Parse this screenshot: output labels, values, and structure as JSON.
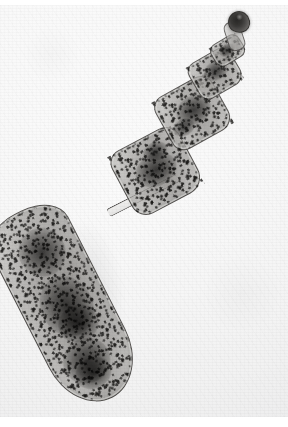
{
  "image": {
    "kind": "photomicrograph",
    "medium": "light microscopy, stained whole mount",
    "rendering": "grayscale",
    "subject": "adult cestode (tapeworm) whole specimen",
    "orientation": "diagonal, scolex at upper right, gravid proglottid at lower left",
    "caption": "Grayscale photomicrograph of an adult tapeworm whole mount: dark scolex at upper right, short neck, three small proglottids, and a large gravid terminal proglottid packed with dark eggs.",
    "background_color": "#f4f4f4",
    "border_color": "#ffffff",
    "has_scale_bar": false,
    "has_labels": false,
    "has_text": false
  },
  "canvas": {
    "width_px": 288,
    "height_px": 427,
    "photo_top_px": 5,
    "photo_height_px": 412
  },
  "palette": {
    "background": "#f4f4f4",
    "background_light": "#fbfbfb",
    "background_shadow": "#ebebec",
    "tissue_light": "#cdccc9",
    "tissue_mid": "#8e8c89",
    "tissue_dark": "#4a4846",
    "egg_granule": "#191816",
    "scolex_dark": "#1a1917",
    "outline": "#34322f",
    "cuticle_highlight": "#ecebe8"
  },
  "anatomy": {
    "parts": [
      {
        "id": "scolex",
        "label": "Scolex (rostellum)",
        "position": "top right",
        "tone": "darkest",
        "approx_bbox_px": [
          228,
          6,
          22,
          22
        ]
      },
      {
        "id": "neck",
        "label": "Neck",
        "position": "below scolex",
        "tone": "mid grey",
        "approx_bbox_px": [
          226,
          16,
          17,
          30
        ]
      },
      {
        "id": "proglottid-0",
        "label": "Immature proglottid 1",
        "position": "upper right",
        "tone": "mid grey, lightly stippled",
        "approx_bbox_px": [
          211,
          33,
          33,
          25
        ]
      },
      {
        "id": "proglottid-1",
        "label": "Immature proglottid 2",
        "position": "upper right",
        "tone": "mid grey, stippled",
        "approx_bbox_px": [
          191,
          48,
          48,
          41
        ]
      },
      {
        "id": "proglottid-2",
        "label": "Mature proglottid 1",
        "position": "upper middle",
        "tone": "mid grey with dark central mass",
        "approx_bbox_px": [
          160,
          78,
          65,
          60
        ]
      },
      {
        "id": "proglottid-3",
        "label": "Mature proglottid 2",
        "position": "middle",
        "tone": "mid grey with dark central mass",
        "approx_bbox_px": [
          118,
          130,
          76,
          72
        ]
      },
      {
        "id": "junction",
        "label": "Segment junction",
        "position": "between mature and gravid proglottid",
        "tone": "pale band with double outline",
        "approx_bbox_px": [
          104,
          186,
          78,
          9
        ]
      },
      {
        "id": "gravid-proglottid",
        "label": "Gravid terminal proglottid",
        "position": "lower left",
        "tone": "pale cuticle filled with dense dark egg stipple",
        "approx_bbox_px": [
          22,
          196,
          86,
          208
        ]
      }
    ],
    "egg_clusters": [
      {
        "id": "cluster-apex",
        "note": "dense dark mass near distal tip",
        "approx_center_px": [
          62,
          355
        ]
      },
      {
        "id": "cluster-mid",
        "note": "broad granular band mid-segment",
        "approx_center_px": [
          88,
          275
        ]
      },
      {
        "id": "cluster-upper",
        "note": "granular band near junction",
        "approx_center_px": [
          116,
          228
        ]
      },
      {
        "id": "cluster-pg3",
        "note": "dark uterine mass in proglottid",
        "approx_center_px": [
          155,
          165
        ]
      },
      {
        "id": "cluster-pg2",
        "note": "dark uterine mass in proglottid",
        "approx_center_px": [
          192,
          105
        ]
      },
      {
        "id": "cluster-pg1",
        "note": "small dark mass",
        "approx_center_px": [
          215,
          66
        ]
      }
    ]
  }
}
